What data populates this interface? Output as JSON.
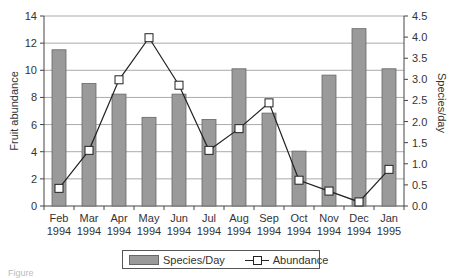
{
  "chart_data": {
    "type": "bar+line",
    "title": "",
    "categories": [
      "Feb 1994",
      "Mar 1994",
      "Apr 1994",
      "May 1994",
      "Jun 1994",
      "Jul 1994",
      "Aug 1994",
      "Sep 1994",
      "Oct 1994",
      "Nov 1994",
      "Dec 1994",
      "Jan 1995"
    ],
    "category_lines": [
      [
        "Feb",
        "1994"
      ],
      [
        "Mar",
        "1994"
      ],
      [
        "Apr",
        "1994"
      ],
      [
        "May",
        "1994"
      ],
      [
        "Jun",
        "1994"
      ],
      [
        "Jul",
        "1994"
      ],
      [
        "Aug",
        "1994"
      ],
      [
        "Sep",
        "1994"
      ],
      [
        "Oct",
        "1994"
      ],
      [
        "Nov",
        "1994"
      ],
      [
        "Dec",
        "1994"
      ],
      [
        "Jan",
        "1995"
      ]
    ],
    "series": [
      {
        "name": "Species/Day",
        "type": "bar",
        "axis": "right",
        "color": "#9a9a9a",
        "values": [
          3.7,
          2.9,
          2.65,
          2.1,
          2.65,
          2.05,
          3.25,
          2.2,
          1.3,
          3.1,
          4.2,
          3.25
        ]
      },
      {
        "name": "Abundance",
        "type": "line",
        "axis": "left",
        "marker": "open-square",
        "color": "#222222",
        "values": [
          1.3,
          4.1,
          9.3,
          12.4,
          8.9,
          4.1,
          5.7,
          7.6,
          1.9,
          1.1,
          0.3,
          2.7
        ]
      }
    ],
    "left_axis": {
      "label": "Fruit abundance",
      "ylim": [
        0,
        14
      ],
      "ticks": [
        "0",
        "2",
        "4",
        "6",
        "8",
        "10",
        "12",
        "14"
      ]
    },
    "right_axis": {
      "label": "Species/day",
      "ylim": [
        0,
        4.5
      ],
      "ticks": [
        "0.0",
        "0.5",
        "1.0",
        "1.5",
        "2.0",
        "2.5",
        "3.0",
        "3.5",
        "4.0",
        "4.5"
      ]
    },
    "grid": true,
    "legend_position": "bottom"
  },
  "legend": {
    "bar_label": "Species/Day",
    "line_label": "Abundance"
  },
  "caption": "Figure"
}
